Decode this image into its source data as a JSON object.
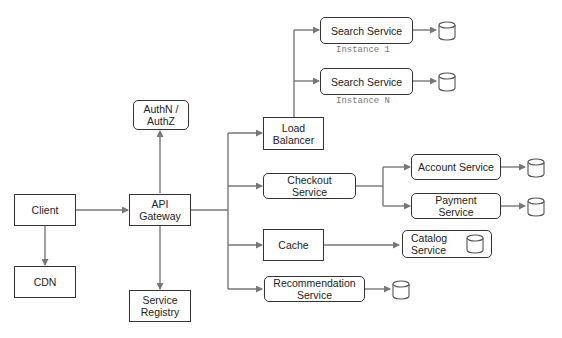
{
  "diagram": {
    "nodes": {
      "client": {
        "label": "Client"
      },
      "cdn": {
        "label": "CDN"
      },
      "api_gateway": {
        "label": "API\nGateway"
      },
      "auth": {
        "label": "AuthN /\nAuthZ"
      },
      "service_registry": {
        "label": "Service\nRegistry"
      },
      "load_balancer": {
        "label": "Load\nBalancer"
      },
      "search1": {
        "label": "Search Service",
        "instance": "Instance 1"
      },
      "searchN": {
        "label": "Search Service",
        "instance": "Instance N"
      },
      "checkout": {
        "label": "Checkout\nService"
      },
      "account": {
        "label": "Account Service"
      },
      "payment": {
        "label": "Payment\nService"
      },
      "cache": {
        "label": "Cache"
      },
      "catalog": {
        "label": "Catalog\nService"
      },
      "recommendation": {
        "label": "Recommendation\nService"
      }
    },
    "databases": [
      "search1-db",
      "searchN-db",
      "account-db",
      "payment-db",
      "catalog-db",
      "recommendation-db"
    ],
    "edges": [
      [
        "client",
        "api_gateway"
      ],
      [
        "client",
        "cdn"
      ],
      [
        "api_gateway",
        "auth"
      ],
      [
        "api_gateway",
        "service_registry"
      ],
      [
        "api_gateway",
        "load_balancer"
      ],
      [
        "api_gateway",
        "checkout"
      ],
      [
        "api_gateway",
        "cache"
      ],
      [
        "api_gateway",
        "recommendation"
      ],
      [
        "load_balancer",
        "search1"
      ],
      [
        "load_balancer",
        "searchN"
      ],
      [
        "checkout",
        "account"
      ],
      [
        "checkout",
        "payment"
      ],
      [
        "cache",
        "catalog"
      ],
      [
        "search1",
        "search1-db"
      ],
      [
        "searchN",
        "searchN-db"
      ],
      [
        "account",
        "account-db"
      ],
      [
        "payment",
        "payment-db"
      ],
      [
        "recommendation",
        "recommendation-db"
      ]
    ],
    "colors": {
      "line": "#777777",
      "border": "#333333"
    }
  }
}
